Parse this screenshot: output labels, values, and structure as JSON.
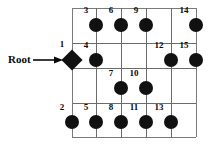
{
  "diagram": {
    "background_color": "#ffffff",
    "node_color": "#111111",
    "grid_color": "#6b6b6b",
    "label_color": "#0a0a0a",
    "width": 211,
    "height": 146,
    "root_annotation": {
      "label": "Root",
      "arrow_glyph": "⟶",
      "points_to_node": "1"
    },
    "grid": {
      "vertical_lines_x": [
        72,
        96,
        121,
        146,
        171,
        196
      ],
      "horizontal_lines_y": [
        8,
        43,
        68,
        103,
        137
      ],
      "columns": 6,
      "rows": 5
    },
    "node_radius": 7,
    "root_size": 15,
    "nodes": [
      {
        "id": "1",
        "label": "1",
        "x": 72,
        "y": 60,
        "shape": "diamond",
        "label_dx": -10,
        "label_dy": -11
      },
      {
        "id": "2",
        "label": "2",
        "x": 72,
        "y": 122,
        "shape": "circle",
        "label_dx": -10,
        "label_dy": -10
      },
      {
        "id": "3",
        "label": "3",
        "x": 96,
        "y": 25,
        "shape": "circle",
        "label_dx": -10,
        "label_dy": -10
      },
      {
        "id": "4",
        "label": "4",
        "x": 96,
        "y": 60,
        "shape": "circle",
        "label_dx": -10,
        "label_dy": -10
      },
      {
        "id": "5",
        "label": "5",
        "x": 96,
        "y": 122,
        "shape": "circle",
        "label_dx": -10,
        "label_dy": -10
      },
      {
        "id": "6",
        "label": "6",
        "x": 121,
        "y": 25,
        "shape": "circle",
        "label_dx": -10,
        "label_dy": -10
      },
      {
        "id": "7",
        "label": "7",
        "x": 121,
        "y": 88,
        "shape": "circle",
        "label_dx": -10,
        "label_dy": -10
      },
      {
        "id": "8",
        "label": "8",
        "x": 121,
        "y": 122,
        "shape": "circle",
        "label_dx": -10,
        "label_dy": -10
      },
      {
        "id": "9",
        "label": "9",
        "x": 146,
        "y": 25,
        "shape": "circle",
        "label_dx": -10,
        "label_dy": -10
      },
      {
        "id": "10",
        "label": "10",
        "x": 146,
        "y": 88,
        "shape": "circle",
        "label_dx": -12,
        "label_dy": -10
      },
      {
        "id": "11",
        "label": "11",
        "x": 146,
        "y": 122,
        "shape": "circle",
        "label_dx": -12,
        "label_dy": -10
      },
      {
        "id": "12",
        "label": "12",
        "x": 171,
        "y": 60,
        "shape": "circle",
        "label_dx": -12,
        "label_dy": -10
      },
      {
        "id": "13",
        "label": "13",
        "x": 171,
        "y": 122,
        "shape": "circle",
        "label_dx": -12,
        "label_dy": -10
      },
      {
        "id": "14",
        "label": "14",
        "x": 196,
        "y": 25,
        "shape": "circle",
        "label_dx": -12,
        "label_dy": -10
      },
      {
        "id": "15",
        "label": "15",
        "x": 196,
        "y": 60,
        "shape": "circle",
        "label_dx": -12,
        "label_dy": -10
      }
    ]
  }
}
